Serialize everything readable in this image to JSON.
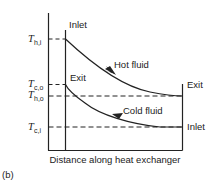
{
  "figure": {
    "panel_label": "(b)",
    "x_axis_label": "Distance along heat exchanger",
    "y_axis_labels": [
      {
        "symbol": "T",
        "subscript": "h,i",
        "meaning": "hot fluid inlet temperature"
      },
      {
        "symbol": "T",
        "subscript": "c,o",
        "meaning": "cold fluid outlet temperature"
      },
      {
        "symbol": "T",
        "subscript": "h,o",
        "meaning": "hot fluid outlet temperature"
      },
      {
        "symbol": "T",
        "subscript": "c,i",
        "meaning": "cold fluid inlet temperature"
      }
    ],
    "annotations": {
      "left_top": "Inlet",
      "left_mid": "Exit",
      "right_top": "Exit",
      "right_bottom": "Inlet"
    },
    "curves": {
      "hot": "Hot fluid",
      "cold": "Cold fluid"
    },
    "flow_type": "counterflow",
    "colors": {
      "line": "#222222",
      "background": "#ffffff"
    }
  }
}
